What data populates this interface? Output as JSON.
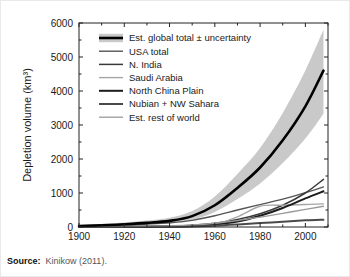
{
  "source": {
    "label": "Source:",
    "text": "Kinikow (2011)."
  },
  "chart_data": {
    "type": "line",
    "title": "",
    "xlabel": "",
    "ylabel": "Depletion volume (km³)",
    "xlim": [
      1900,
      2010
    ],
    "ylim": [
      0,
      6000
    ],
    "xticks": [
      1900,
      1920,
      1940,
      1960,
      1980,
      2000
    ],
    "yticks": [
      0,
      1000,
      2000,
      3000,
      4000,
      5000,
      6000
    ],
    "xtick_labels": [
      "1900",
      "1920",
      "1940",
      "1960",
      "1980",
      "2000"
    ],
    "ytick_labels": [
      "0",
      "1000",
      "2000",
      "3000",
      "4000",
      "5000",
      "6000"
    ],
    "grid": false,
    "legend_position": "upper left",
    "x": [
      1900,
      1910,
      1920,
      1930,
      1940,
      1950,
      1960,
      1970,
      1980,
      1990,
      2000,
      2008
    ],
    "series": [
      {
        "name": "Est. global total ± uncertainty",
        "color": "#000000",
        "width": 2.6,
        "band_color": "#c9c9c9",
        "values": [
          30,
          50,
          80,
          120,
          180,
          320,
          640,
          1150,
          1750,
          2550,
          3550,
          4600
        ],
        "band_upper": [
          60,
          90,
          130,
          190,
          270,
          470,
          900,
          1560,
          2320,
          3350,
          4600,
          5800
        ],
        "band_lower": [
          10,
          25,
          45,
          70,
          110,
          210,
          440,
          820,
          1280,
          1880,
          2600,
          3330
        ]
      },
      {
        "name": "USA total",
        "color": "#555555",
        "width": 1.4,
        "values": [
          20,
          35,
          55,
          85,
          125,
          195,
          330,
          500,
          660,
          820,
          1010,
          1180
        ]
      },
      {
        "name": "N. India",
        "color": "#3a3a3a",
        "width": 1.5,
        "values": [
          2,
          5,
          10,
          18,
          30,
          55,
          110,
          220,
          390,
          640,
          1000,
          1400
        ]
      },
      {
        "name": "Saudi Arabia",
        "color": "#a6a6a6",
        "width": 1.4,
        "values": [
          0,
          0,
          2,
          5,
          10,
          25,
          90,
          300,
          610,
          640,
          660,
          680
        ]
      },
      {
        "name": "North China Plain",
        "color": "#1c1c1c",
        "width": 2.0,
        "values": [
          0,
          1,
          3,
          6,
          12,
          28,
          70,
          160,
          330,
          560,
          840,
          1050
        ]
      },
      {
        "name": "Nubian + NW Sahara",
        "color": "#4a4a4a",
        "width": 2.0,
        "values": [
          0,
          1,
          2,
          4,
          8,
          18,
          40,
          75,
          115,
          155,
          195,
          215
        ]
      },
      {
        "name": "Est. rest of world",
        "color": "#9a9a9a",
        "width": 1.3,
        "values": [
          5,
          8,
          14,
          22,
          35,
          60,
          110,
          190,
          290,
          400,
          520,
          610
        ]
      }
    ]
  }
}
